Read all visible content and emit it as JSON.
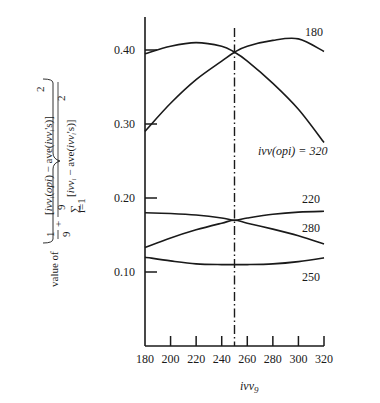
{
  "chart_data": {
    "type": "line",
    "title": "",
    "xlabel": "ivv_9",
    "ylabel": "value of { 1/9 + [ivv_i(opi) − ave(ivv_i's)]^2 / Σ_{i=1}^{9} [ivv_i − ave(ivv_i's)]^2 }",
    "xlim": [
      180,
      320
    ],
    "ylim": [
      0.0,
      0.45
    ],
    "x_ticks": [
      180,
      200,
      220,
      240,
      260,
      280,
      300,
      320
    ],
    "x_tick_labels": [
      "180",
      "200",
      "220",
      "240",
      "260",
      "280",
      "300",
      "320"
    ],
    "y_ticks": [
      0.1,
      0.2,
      0.3,
      0.4
    ],
    "y_tick_labels": [
      "0.10",
      "0.20",
      "0.30",
      "0.40"
    ],
    "grid": false,
    "x": [
      180,
      200,
      220,
      240,
      250,
      260,
      280,
      300,
      320
    ],
    "series": [
      {
        "name": "ivv(opi) = 320",
        "label": "ivv(opi) = 320",
        "values": [
          0.395,
          0.405,
          0.41,
          0.405,
          0.397,
          0.385,
          0.355,
          0.32,
          0.275
        ]
      },
      {
        "name": "180",
        "label": "180",
        "values": [
          0.29,
          0.328,
          0.36,
          0.385,
          0.397,
          0.405,
          0.413,
          0.415,
          0.398
        ]
      },
      {
        "name": "220",
        "label": "220",
        "values": [
          0.18,
          0.179,
          0.177,
          0.173,
          0.17,
          0.173,
          0.178,
          0.181,
          0.182
        ]
      },
      {
        "name": "280",
        "label": "280",
        "values": [
          0.133,
          0.146,
          0.157,
          0.166,
          0.17,
          0.166,
          0.158,
          0.149,
          0.138
        ]
      },
      {
        "name": "250",
        "label": "250",
        "values": [
          0.12,
          0.115,
          0.111,
          0.11,
          0.11,
          0.11,
          0.111,
          0.114,
          0.119
        ]
      }
    ],
    "annotations": [
      {
        "type": "vertical_line",
        "x": 250,
        "style": "dash-dot"
      }
    ],
    "legend_position": "inline-right"
  },
  "labels": {
    "x_axis": "ivv",
    "x_axis_sub": "9",
    "y_prefix": "value of",
    "y_one": "1",
    "y_nine": "9",
    "y_plus": "+",
    "y_numerator": "[ivvᵢ(opi) − ave(ivvᵢ's)]",
    "y_denominator": "[ivvᵢ − ave(ivvᵢ's)]",
    "y_sup": "2",
    "y_sum_top": "9",
    "y_sum_bottom": "i=1",
    "curve_180": "180",
    "curve_320": "ivv(opi) = 320",
    "curve_220": "220",
    "curve_280": "280",
    "curve_250": "250"
  }
}
